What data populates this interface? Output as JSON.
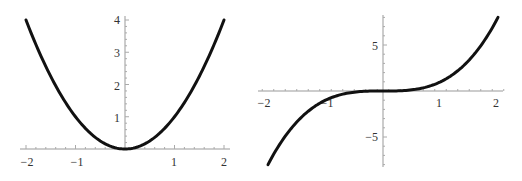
{
  "chart_data": [
    {
      "type": "line",
      "title": "",
      "function": "y = x^2",
      "xlabel": "",
      "ylabel": "",
      "xlim": [
        -2,
        2
      ],
      "ylim": [
        0,
        4
      ],
      "grid": false,
      "legend": null,
      "x_ticks": [
        -2,
        -1,
        1,
        2
      ],
      "x_tick_labels": [
        "−2",
        "−1",
        "1",
        "2"
      ],
      "y_ticks": [
        1,
        2,
        3,
        4
      ],
      "y_tick_labels": [
        "1",
        "2",
        "3",
        "4"
      ],
      "series": [
        {
          "name": "x^2",
          "color": "#111111",
          "x": [
            -2,
            -1.5,
            -1,
            -0.5,
            0,
            0.5,
            1,
            1.5,
            2
          ],
          "y": [
            4,
            2.25,
            1,
            0.25,
            0,
            0.25,
            1,
            2.25,
            4
          ]
        }
      ]
    },
    {
      "type": "line",
      "title": "",
      "function": "y = x^3",
      "xlabel": "",
      "ylabel": "",
      "xlim": [
        -2,
        2
      ],
      "ylim": [
        -8,
        8
      ],
      "grid": false,
      "legend": null,
      "x_ticks": [
        -2,
        -1,
        1,
        2
      ],
      "x_tick_labels": [
        "−2",
        "−1",
        "1",
        "2"
      ],
      "y_ticks": [
        -5,
        5
      ],
      "y_tick_labels": [
        "−5",
        "5"
      ],
      "series": [
        {
          "name": "x^3",
          "color": "#111111",
          "x": [
            -2,
            -1.5,
            -1,
            -0.5,
            0,
            0.5,
            1,
            1.5,
            2
          ],
          "y": [
            -8,
            -3.375,
            -1,
            -0.125,
            0,
            0.125,
            1,
            3.375,
            8
          ]
        }
      ]
    }
  ],
  "plots": {
    "left": {
      "x_labels": [
        "−2",
        "−1",
        "1",
        "2"
      ],
      "y_labels": [
        "1",
        "2",
        "3",
        "4"
      ]
    },
    "right": {
      "x_labels": [
        "−2",
        "−1",
        "1",
        "2"
      ],
      "y_labels": [
        "5",
        "−5"
      ]
    }
  }
}
